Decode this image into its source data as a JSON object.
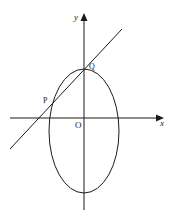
{
  "diagram": {
    "type": "geometry",
    "labels": {
      "x_axis": "x",
      "y_axis": "y",
      "origin": "O",
      "point_p": "P",
      "point_q": "Q"
    },
    "colors": {
      "stroke": "#1a1a1a",
      "background": "#ffffff"
    }
  }
}
